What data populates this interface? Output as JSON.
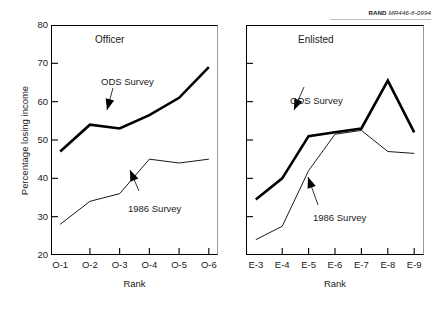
{
  "source_note": {
    "brand": "RAND",
    "report_id": "MR446-8-0994"
  },
  "chart_data": {
    "type": "line",
    "title": "",
    "ylabel": "Percentage losing income",
    "xlabel": "Rank",
    "ylim": [
      20,
      80
    ],
    "yticks": [
      20,
      30,
      40,
      50,
      60,
      70,
      80
    ],
    "grid": false,
    "legend_position": "inline-annotations",
    "panels": [
      {
        "name": "officer-panel",
        "title": "Officer",
        "xlabel": "Rank",
        "categories": [
          "O-1",
          "O-2",
          "O-3",
          "O-4",
          "O-5",
          "O-6"
        ],
        "series": [
          {
            "name": "ODS Survey",
            "style": "thick",
            "values": [
              47,
              54,
              53,
              56.5,
              61,
              69
            ],
            "annotation": "ODS Survey"
          },
          {
            "name": "1986 Survey",
            "style": "thin",
            "values": [
              28,
              34,
              36,
              45,
              44,
              45
            ],
            "annotation": "1986 Survey"
          }
        ]
      },
      {
        "name": "enlisted-panel",
        "title": "Enlisted",
        "xlabel": "Rank",
        "categories": [
          "E-3",
          "E-4",
          "E-5",
          "E-6",
          "E-7",
          "E-8",
          "E-9"
        ],
        "series": [
          {
            "name": "ODS Survey",
            "style": "thick",
            "values": [
              34.5,
              40,
              51,
              52,
              53,
              65.5,
              52
            ],
            "annotation": "ODS Survey"
          },
          {
            "name": "1986 Survey",
            "style": "thin",
            "values": [
              24,
              27.5,
              42,
              51.5,
              52.5,
              47,
              46.5
            ],
            "annotation": "1986 Survey"
          }
        ]
      }
    ]
  },
  "colors": {
    "line": "#000000",
    "axis": "#000000",
    "text": "#1a1a1a",
    "background": "#ffffff"
  }
}
